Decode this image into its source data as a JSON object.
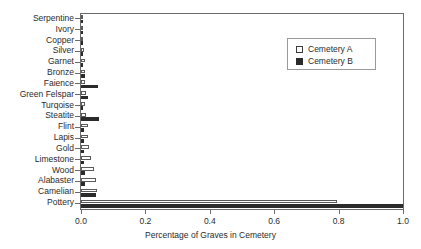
{
  "chart_data": {
    "type": "bar",
    "orientation": "horizontal",
    "title": "",
    "xlabel": "Percentage of Graves in Cemetery",
    "ylabel": "",
    "xlim": [
      0.0,
      1.0
    ],
    "xticks": [
      "0.0",
      "0.2",
      "0.4",
      "0.6",
      "0.8",
      "1.0"
    ],
    "xtick_values": [
      0.0,
      0.2,
      0.4,
      0.6,
      0.8,
      1.0
    ],
    "grid": false,
    "legend_position": "upper right",
    "categories": [
      "Serpentine",
      "Ivory",
      "Copper",
      "Silver",
      "Garnet",
      "Bronze",
      "Faience",
      "Green Felspar",
      "Turqoise",
      "Steatite",
      "Flint",
      "Lapis",
      "Gold",
      "Limestone",
      "Wood",
      "Alabaster",
      "Camelian",
      "Pottery"
    ],
    "series": [
      {
        "name": "Cemetery A",
        "color": "#ffffff",
        "edge_color": "#5a5a5a",
        "values": [
          0.005,
          0.006,
          0.007,
          0.01,
          0.011,
          0.012,
          0.013,
          0.016,
          0.013,
          0.017,
          0.022,
          0.023,
          0.024,
          0.031,
          0.04,
          0.047,
          0.05,
          0.795
        ]
      },
      {
        "name": "Cemetery B",
        "color": "#2b2b2b",
        "edge_color": "#2b2b2b",
        "values": [
          0.004,
          0.005,
          0.006,
          0.006,
          0.007,
          0.012,
          0.052,
          0.021,
          0.007,
          0.055,
          0.008,
          0.009,
          0.008,
          0.01,
          0.011,
          0.012,
          0.046,
          1.0
        ]
      }
    ]
  },
  "legend": {
    "entries": [
      {
        "label": "Cemetery A",
        "swatch": "open-square"
      },
      {
        "label": "Cemetery B",
        "swatch": "filled-square"
      }
    ]
  }
}
